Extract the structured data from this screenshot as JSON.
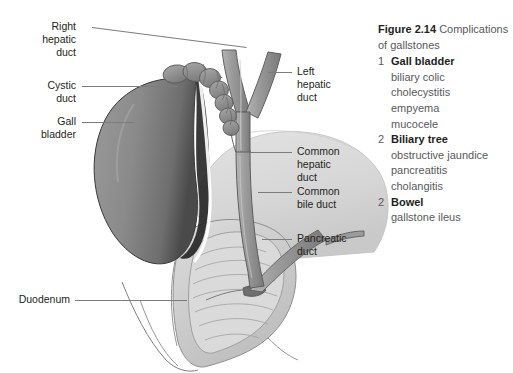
{
  "figure": {
    "label": "Figure 2.14",
    "caption_rest": "Complications",
    "caption_line2": "of gallstones"
  },
  "complications": [
    {
      "number": "1",
      "title": "Gall bladder",
      "items": [
        "biliary colic",
        "cholecystitis",
        "empyema",
        "mucocele"
      ]
    },
    {
      "number": "2",
      "title": "Biliary tree",
      "items": [
        "obstructive jaundice",
        "pancreatitis",
        "cholangitis"
      ]
    },
    {
      "number": "2",
      "title": "Bowel",
      "items": [
        "gallstone ileus"
      ]
    }
  ],
  "callouts": {
    "right_hepatic_duct": "Right\nhepatic\nduct",
    "cystic_duct": "Cystic\nduct",
    "gall_bladder": "Gall\nbladder",
    "duodenum": "Duodenum",
    "left_hepatic_duct": "Left\nhepatic\nduct",
    "common_hepatic_duct": "Common\nhepatic\nduct",
    "common_bile_duct": "Common\nbile duct",
    "pancreatic_duct": "Pancreatic\nduct"
  },
  "colors": {
    "leader": "#7c7c7c",
    "label_text": "#231f20",
    "caption_text": "#58595b",
    "gallbladder_fill": "#8a8a8a",
    "gallbladder_edge": "#1a1a1a",
    "duct_fill": "#9a9a9a",
    "duct_outline": "#5e5e5e",
    "organ_pale": "#d9d9d9",
    "duodenum_fill": "#cfcfcf",
    "background": "#ffffff"
  }
}
